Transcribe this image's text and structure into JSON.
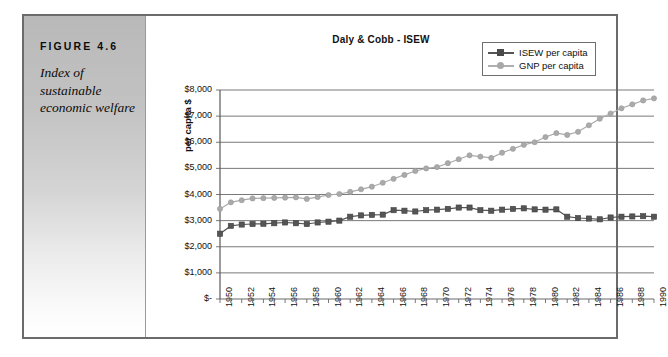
{
  "figure": {
    "label": "FIGURE 4.6",
    "caption": "Index of sustainable economic welfare"
  },
  "legend": {
    "position": "top-right",
    "entries": [
      {
        "name": "ISEW per capita",
        "marker": "square-marker",
        "color": "#555555"
      },
      {
        "name": "GNP per capita",
        "marker": "circle-marker",
        "color": "#aaaaaa"
      }
    ]
  },
  "chart_data": {
    "type": "line",
    "title": "Daly & Cobb - ISEW",
    "xlabel": "",
    "ylabel": "per capita $",
    "ylim": [
      0,
      8000
    ],
    "ytick_step": 1000,
    "ytick_labels": [
      "$8,000",
      "$7,000",
      "$6,000",
      "$5,000",
      "$4,000",
      "$3,000",
      "$2,000",
      "$1,000",
      "$-"
    ],
    "ytick_values": [
      8000,
      7000,
      6000,
      5000,
      4000,
      3000,
      2000,
      1000,
      0
    ],
    "grid": true,
    "xlim": [
      1950,
      1990
    ],
    "x": [
      1950,
      1951,
      1952,
      1953,
      1954,
      1955,
      1956,
      1957,
      1958,
      1959,
      1960,
      1961,
      1962,
      1963,
      1964,
      1965,
      1966,
      1967,
      1968,
      1969,
      1970,
      1971,
      1972,
      1973,
      1974,
      1975,
      1976,
      1977,
      1978,
      1979,
      1980,
      1981,
      1982,
      1983,
      1984,
      1985,
      1986,
      1987,
      1988,
      1989,
      1990
    ],
    "xtick_labels": [
      "1950",
      "1952",
      "1954",
      "1956",
      "1958",
      "1960",
      "1962",
      "1964",
      "1966",
      "1968",
      "1970",
      "1972",
      "1974",
      "1976",
      "1978",
      "1980",
      "1982",
      "1984",
      "1986",
      "1988",
      "1990"
    ],
    "xtick_values": [
      1950,
      1952,
      1954,
      1956,
      1958,
      1960,
      1962,
      1964,
      1966,
      1968,
      1970,
      1972,
      1974,
      1976,
      1978,
      1980,
      1982,
      1984,
      1986,
      1988,
      1990
    ],
    "series": [
      {
        "name": "ISEW per capita",
        "color": "#555555",
        "marker": "square",
        "values": [
          2500,
          2800,
          2850,
          2870,
          2880,
          2900,
          2930,
          2900,
          2870,
          2930,
          2960,
          3000,
          3150,
          3200,
          3220,
          3230,
          3400,
          3380,
          3350,
          3400,
          3420,
          3450,
          3500,
          3500,
          3400,
          3380,
          3420,
          3450,
          3470,
          3430,
          3420,
          3430,
          3150,
          3100,
          3080,
          3050,
          3120,
          3150,
          3160,
          3170,
          3150
        ]
      },
      {
        "name": "GNP per capita",
        "color": "#aaaaaa",
        "marker": "circle",
        "values": [
          3450,
          3700,
          3780,
          3850,
          3860,
          3870,
          3880,
          3890,
          3830,
          3900,
          3980,
          4020,
          4100,
          4200,
          4300,
          4450,
          4600,
          4750,
          4900,
          5000,
          5050,
          5200,
          5350,
          5500,
          5450,
          5400,
          5600,
          5750,
          5900,
          6000,
          6200,
          6350,
          6280,
          6400,
          6650,
          6900,
          7100,
          7300,
          7450,
          7600,
          7680
        ]
      }
    ]
  }
}
